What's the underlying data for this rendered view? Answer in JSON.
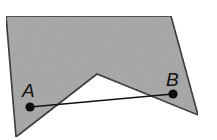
{
  "diagram": {
    "polygon": {
      "points": [
        [
          6,
          16
        ],
        [
          171,
          16
        ],
        [
          198,
          115
        ],
        [
          97,
          74
        ],
        [
          16,
          137
        ]
      ],
      "fill": "#a5a5a5",
      "stroke": "#1a1a1a"
    },
    "points": [
      {
        "label": "A",
        "x": 30,
        "y": 107,
        "label_x": 22,
        "label_y": 97
      },
      {
        "label": "B",
        "x": 173,
        "y": 94,
        "label_x": 166,
        "label_y": 86
      }
    ],
    "segment": {
      "from": "A",
      "to": "B",
      "stroke": "#111111"
    },
    "background": "#ffffff"
  }
}
